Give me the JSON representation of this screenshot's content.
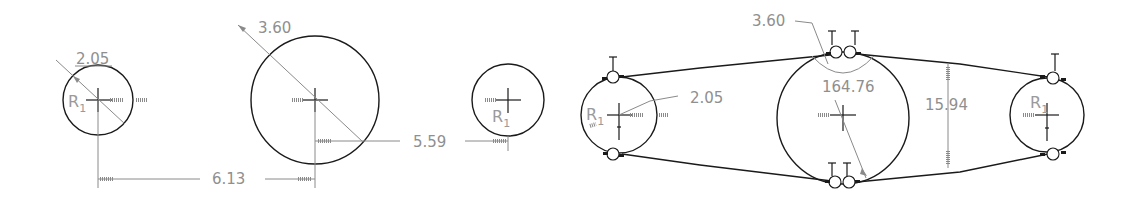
{
  "sketch": {
    "dimensions": {
      "radius_small_left": "2.05",
      "radius_large_mid": "3.60",
      "horizontal_distance": "6.13",
      "vertical_offset_distance": "5.59",
      "belt_radius_large": "3.60",
      "belt_radius_small": "2.05",
      "belt_angle": "164.76",
      "belt_height": "15.94"
    },
    "labels": {
      "radius_symbol": "R",
      "radius_subscript": "1",
      "tangent_symbol": "T"
    },
    "colors": {
      "geometry": "#1a1a1a",
      "dimension": "#8f8f8f",
      "background": "#ffffff"
    }
  }
}
